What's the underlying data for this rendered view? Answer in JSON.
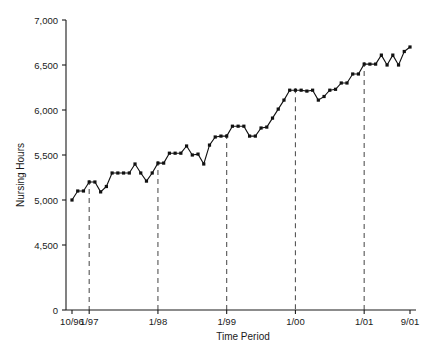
{
  "chart_data": {
    "type": "line",
    "title": "",
    "xlabel": "Time Period",
    "ylabel": "Nursing Hours",
    "grid": false,
    "legend": "none",
    "ylim": [
      0,
      7000
    ],
    "ytick_values": [
      0,
      4500,
      5000,
      5500,
      6000,
      6500,
      7000
    ],
    "ytick_labels": [
      "0",
      "4,500",
      "5,000",
      "5,500",
      "6,000",
      "6,500",
      "7,000"
    ],
    "y_axis_break_between": [
      0,
      4500
    ],
    "xtick_labels": [
      "10/96",
      "1/97",
      "1/98",
      "1/99",
      "1/00",
      "1/01",
      "9/01"
    ],
    "xtick_indices": [
      0,
      3,
      15,
      27,
      39,
      51,
      59
    ],
    "x": [
      "10/96",
      "11/96",
      "12/96",
      "1/97",
      "2/97",
      "3/97",
      "4/97",
      "5/97",
      "6/97",
      "7/97",
      "8/97",
      "9/97",
      "10/97",
      "11/97",
      "12/97",
      "1/98",
      "2/98",
      "3/98",
      "4/98",
      "5/98",
      "6/98",
      "7/98",
      "8/98",
      "9/98",
      "10/98",
      "11/98",
      "12/98",
      "1/99",
      "2/99",
      "3/99",
      "4/99",
      "5/99",
      "6/99",
      "7/99",
      "8/99",
      "9/99",
      "10/99",
      "11/99",
      "12/99",
      "1/00",
      "2/00",
      "3/00",
      "4/00",
      "5/00",
      "6/00",
      "7/00",
      "8/00",
      "9/00",
      "10/00",
      "11/00",
      "12/00",
      "1/01",
      "2/01",
      "3/01",
      "4/01",
      "5/01",
      "6/01",
      "7/01",
      "8/01",
      "9/01"
    ],
    "values": [
      5000,
      5100,
      5100,
      5200,
      5200,
      5090,
      5150,
      5300,
      5300,
      5300,
      5300,
      5400,
      5300,
      5210,
      5300,
      5410,
      5410,
      5520,
      5520,
      5520,
      5600,
      5500,
      5510,
      5400,
      5610,
      5700,
      5710,
      5710,
      5820,
      5820,
      5820,
      5710,
      5710,
      5800,
      5810,
      5910,
      6010,
      6110,
      6220,
      6220,
      6220,
      6210,
      6220,
      6110,
      6150,
      6220,
      6230,
      6300,
      6300,
      6400,
      6400,
      6510,
      6510,
      6510,
      6610,
      6500,
      6610,
      6500,
      6650,
      6700
    ],
    "event_lines": [
      {
        "label": "1/97",
        "index": 3
      },
      {
        "label": "1/98",
        "index": 15
      },
      {
        "label": "1/99",
        "index": 27
      },
      {
        "label": "1/00",
        "index": 39
      },
      {
        "label": "1/01",
        "index": 51
      }
    ],
    "series": [
      {
        "name": "Nursing Hours",
        "marker": "filled-square",
        "color": "#111111"
      }
    ]
  }
}
